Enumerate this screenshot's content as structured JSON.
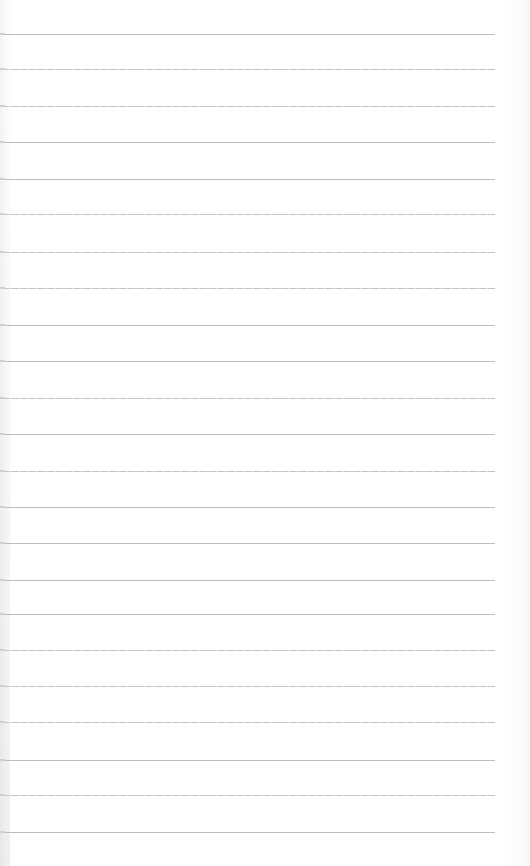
{
  "page": {
    "type": "blank lined notebook paper",
    "background_color": "#ffffff",
    "rule_color": "#bdbdbd",
    "rule_left": 2,
    "rule_right": 495,
    "rules": [
      {
        "y": 34,
        "style": "solid"
      },
      {
        "y": 69,
        "style": "dashed"
      },
      {
        "y": 106,
        "style": "dashed"
      },
      {
        "y": 142,
        "style": "solid"
      },
      {
        "y": 179,
        "style": "solid"
      },
      {
        "y": 214,
        "style": "dashed"
      },
      {
        "y": 252,
        "style": "dashed"
      },
      {
        "y": 288,
        "style": "dashed"
      },
      {
        "y": 325,
        "style": "solid"
      },
      {
        "y": 361,
        "style": "solid"
      },
      {
        "y": 398,
        "style": "dashed"
      },
      {
        "y": 434,
        "style": "solid"
      },
      {
        "y": 471,
        "style": "dashed"
      },
      {
        "y": 507,
        "style": "solid"
      },
      {
        "y": 543,
        "style": "solid"
      },
      {
        "y": 580,
        "style": "solid"
      },
      {
        "y": 614,
        "style": "solid"
      },
      {
        "y": 650,
        "style": "dashed"
      },
      {
        "y": 686,
        "style": "dashed"
      },
      {
        "y": 722,
        "style": "dashed"
      },
      {
        "y": 760,
        "style": "solid"
      },
      {
        "y": 795,
        "style": "dashed"
      },
      {
        "y": 832,
        "style": "solid"
      }
    ]
  }
}
